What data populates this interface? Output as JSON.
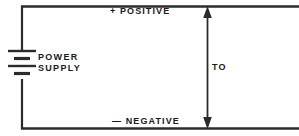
{
  "diagram": {
    "colors": {
      "wire": "#2b2b2b",
      "text": "#1a1a1a",
      "background": "#ffffff"
    },
    "labels": {
      "positive": "+ POSITIVE",
      "negative": "— NEGATIVE",
      "measurement": "TO",
      "source_line1": "POWER",
      "source_line2": "SUPPLY"
    },
    "components": {
      "battery": "battery-symbol",
      "top_wire": "positive-rail",
      "bottom_wire": "negative-rail",
      "left_wire": "left-vertical-wire",
      "measure_arrow": "double-headed-measurement-arrow"
    }
  }
}
